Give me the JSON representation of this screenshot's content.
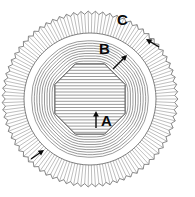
{
  "figure": {
    "type": "technical-cross-section-diagram",
    "background_color": "#ffffff",
    "line_color": "#3c3c3c",
    "label_color": "#0a0a0a",
    "center": {
      "x": 90,
      "y": 99
    },
    "layers": [
      {
        "id": "A",
        "name": "core",
        "shape": "octagon",
        "fill": "horizontal-hatch",
        "radius": 38
      },
      {
        "id": "B",
        "name": "intermediate-rings",
        "shape": "rounded-octagon-rings",
        "count": 9,
        "inner_radius": 41,
        "outer_radius": 63
      },
      {
        "id": "C",
        "name": "outer-serrated-ring",
        "shape": "serrated-annulus",
        "teeth": 150,
        "inner_radius": 66,
        "outer_radius": 88
      }
    ],
    "labels": [
      {
        "id": "label-a",
        "text": "A",
        "x": 101,
        "y": 113,
        "points_to": "core"
      },
      {
        "id": "label-b",
        "text": "B",
        "x": 99,
        "y": 41,
        "points_to": "intermediate-rings"
      },
      {
        "id": "label-c",
        "text": "C",
        "x": 117,
        "y": 12,
        "points_to": "outer-serrated-ring"
      }
    ],
    "leader_arrows": [
      {
        "id": "arrow-a",
        "from": {
          "x": 96,
          "y": 128
        },
        "to": {
          "x": 96,
          "y": 111
        }
      },
      {
        "id": "arrow-b",
        "from": {
          "x": 113,
          "y": 69
        },
        "to": {
          "x": 127,
          "y": 55
        }
      },
      {
        "id": "arrow-c",
        "from": {
          "x": 159,
          "y": 47
        },
        "to": {
          "x": 146,
          "y": 39
        }
      },
      {
        "id": "arrow-d",
        "from": {
          "x": 31,
          "y": 159
        },
        "to": {
          "x": 44,
          "y": 150
        }
      }
    ]
  }
}
